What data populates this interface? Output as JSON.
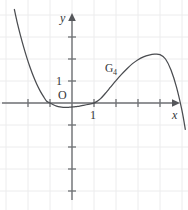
{
  "figure": {
    "background_color": "#ffffff",
    "axis_color": "#6f7175",
    "grid_color": "#ececed",
    "curve_color": "#4a4c50",
    "origin_label": "O",
    "x_axis_label": "x",
    "y_axis_label": "y",
    "x_tick_label": "1",
    "y_tick_label": "1",
    "curve_label_base": "G",
    "curve_label_subscript": "4"
  },
  "chart_data": {
    "type": "line",
    "title": "",
    "xlabel": "x",
    "ylabel": "y",
    "grid": true,
    "legend": "none",
    "annotations": [
      {
        "text": "G4",
        "x": 3.0,
        "y": 2.35
      },
      {
        "text": "O",
        "x": -0.42,
        "y": 0.42
      },
      {
        "text": "1",
        "x": -0.55,
        "y": 1.0
      },
      {
        "text": "1",
        "x": 1.0,
        "y": -0.55
      }
    ],
    "xlim": [
      -3.3,
      5.3
    ],
    "ylim": [
      -4.7,
      4.3
    ],
    "x_ticks": [
      -3,
      -2,
      -1,
      1,
      2,
      3,
      4,
      5
    ],
    "y_ticks": [
      -4,
      -3,
      -2,
      -1,
      1,
      2,
      3
    ],
    "x_ticks_labeled": [
      1
    ],
    "y_ticks_labeled": [
      1
    ],
    "x_axis_arrow": true,
    "y_axis_arrow": true,
    "roots": [
      -1,
      1,
      5
    ],
    "local_maximum": {
      "x": 4.0,
      "y": 2.2
    },
    "local_minimum": {
      "x": 0.0,
      "y": -0.18
    },
    "series": [
      {
        "name": "G4",
        "x": [
          -2.62,
          -2.5,
          -2.35,
          -2.2,
          -2.05,
          -1.9,
          -1.75,
          -1.6,
          -1.45,
          -1.3,
          -1.15,
          -1.0,
          -0.85,
          -0.7,
          -0.55,
          -0.4,
          -0.25,
          -0.1,
          0.05,
          0.2,
          0.35,
          0.5,
          0.65,
          0.8,
          0.95,
          1.1,
          1.3,
          1.5,
          1.75,
          2.0,
          2.25,
          2.5,
          2.75,
          3.0,
          3.25,
          3.5,
          3.75,
          4.0,
          4.25,
          4.5,
          4.75,
          5.0,
          5.15
        ],
        "y": [
          4.25,
          3.7,
          3.1,
          2.55,
          2.05,
          1.6,
          1.2,
          0.85,
          0.55,
          0.3,
          0.08,
          0.0,
          -0.08,
          -0.14,
          -0.18,
          -0.2,
          -0.2,
          -0.19,
          -0.18,
          -0.16,
          -0.14,
          -0.11,
          -0.08,
          -0.05,
          -0.02,
          0.05,
          0.2,
          0.42,
          0.72,
          1.02,
          1.3,
          1.56,
          1.79,
          1.97,
          2.1,
          2.18,
          2.22,
          2.2,
          2.0,
          1.5,
          0.72,
          -0.35,
          -1.2
        ]
      }
    ]
  }
}
